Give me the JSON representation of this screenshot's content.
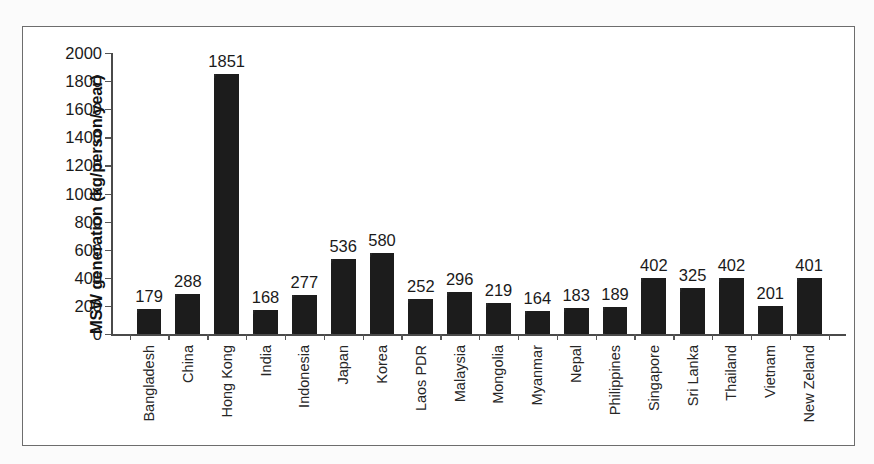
{
  "figure": {
    "frame_border_color": "#6d6d6d",
    "background_color": "#ffffff",
    "bar_color": "#1c1c1c",
    "axis_color": "#4a4a4a",
    "caption": ""
  },
  "chart_data": {
    "type": "bar",
    "title": "",
    "xlabel": "",
    "ylabel": "MSW generation (kg/person/year)",
    "ylim": [
      0,
      2000
    ],
    "ytick_step": 200,
    "yticks": [
      0,
      200,
      400,
      600,
      800,
      1000,
      1200,
      1400,
      1600,
      1800,
      2000
    ],
    "ytick_labels": [
      "0",
      "200",
      "400",
      "600",
      "800",
      "1000",
      "1200",
      "1400",
      "1600",
      "1800",
      "2000"
    ],
    "grid": false,
    "legend": "none",
    "categories": [
      "Bangladesh",
      "China",
      "Hong Kong",
      "India",
      "Indonesia",
      "Japan",
      "Korea",
      "Laos PDR",
      "Malaysia",
      "Mongolia",
      "Myanmar",
      "Nepal",
      "Philippines",
      "Singapore",
      "Sri Lanka",
      "Thailand",
      "Vietnam",
      "New Zeland"
    ],
    "values": [
      179,
      288,
      1851,
      168,
      277,
      536,
      580,
      252,
      296,
      219,
      164,
      183,
      189,
      402,
      325,
      402,
      201,
      401
    ],
    "value_labels": [
      "179",
      "288",
      "1851",
      "168",
      "277",
      "536",
      "580",
      "252",
      "296",
      "219",
      "164",
      "183",
      "189",
      "402",
      "325",
      "402",
      "201",
      "401"
    ]
  }
}
